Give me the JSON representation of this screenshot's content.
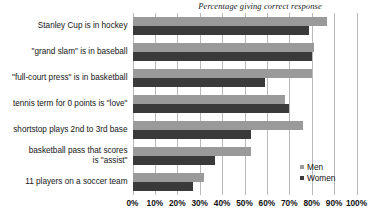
{
  "chart_data": {
    "type": "bar",
    "orientation": "horizontal",
    "title": "Percentage giving correct response",
    "xlabel": "",
    "ylabel": "",
    "xlim": [
      0,
      100
    ],
    "grid": true,
    "legend_position": "bottom-right",
    "xtick_labels": [
      "0%",
      "10%",
      "20%",
      "30%",
      "40%",
      "50%",
      "60%",
      "70%",
      "80%",
      "90%",
      "100%"
    ],
    "xtick_values": [
      0,
      10,
      20,
      30,
      40,
      50,
      60,
      70,
      80,
      90,
      100
    ],
    "categories": [
      "Stanley Cup is in hockey",
      "\"grand slam\" is in baseball",
      "\"full-court press\" is in basketball",
      "tennis term for 0 points is \"love\"",
      "shortstop plays 2nd to 3rd base",
      "basketball pass that scores is \"assist\"",
      "11 players on a soccer team"
    ],
    "category_lines": [
      [
        "Stanley Cup is in hockey"
      ],
      [
        "\"grand slam\" is in baseball"
      ],
      [
        "\"full-court press\" is in basketball"
      ],
      [
        "tennis term for 0 points is \"love\""
      ],
      [
        "shortstop plays 2nd to 3rd base"
      ],
      [
        "basketball pass that scores",
        "is \"assist\""
      ],
      [
        "11 players on a soccer team"
      ]
    ],
    "series": [
      {
        "name": "Men",
        "color": "#9a9a9a",
        "values": [
          87,
          81,
          80,
          68,
          76,
          53,
          32
        ]
      },
      {
        "name": "Women",
        "color": "#3a3a3a",
        "values": [
          79,
          80,
          59,
          70,
          53,
          37,
          27
        ]
      }
    ]
  },
  "legend": {
    "items": [
      {
        "label": "Men",
        "color": "#9a9a9a"
      },
      {
        "label": "Women",
        "color": "#3a3a3a"
      }
    ]
  }
}
